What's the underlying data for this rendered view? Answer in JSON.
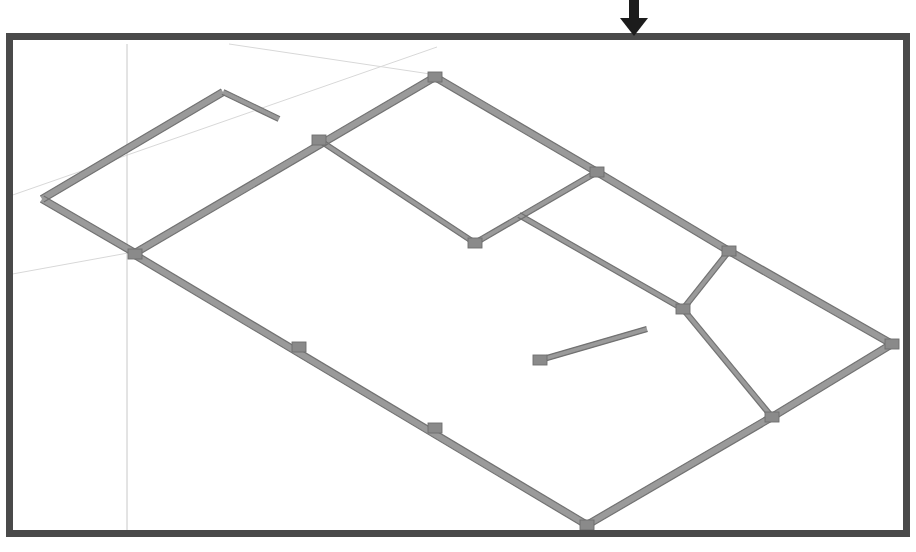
{
  "view": {
    "title": "Floor Plan",
    "background_color": "#ffffff",
    "crop_border_color": "#4a4a4a",
    "crop_border_width": 7,
    "crop_region": {
      "x": 6,
      "y": 33,
      "width": 904,
      "height": 504
    }
  },
  "annotation": {
    "arrow": {
      "name": "crop-region-drag-arrow",
      "direction": "down",
      "color": "#1c1c1c",
      "x": 634,
      "y_top": 0,
      "y_bottom": 36
    }
  },
  "graphics": {
    "wall_color": "#808080",
    "wall_edge_color": "#6e6e6e",
    "wall_fill_color": "#9a9a9a",
    "junction_marker_color": "#8a8a8a",
    "grid_line_color": "#c8c8c8",
    "reference_plane_color": "#d8d8d8",
    "wall_thickness_px": 7,
    "wall_thin_thickness_px": 5
  },
  "grid_lines": [
    {
      "name": "vertical-grid-line",
      "x1": 120,
      "y1": 37,
      "x2": 120,
      "y2": 533
    }
  ],
  "reference_planes": [
    {
      "name": "reference-plane-diagonal-upper",
      "x1": 0,
      "y1": 190,
      "x2": 430,
      "y2": 40
    },
    {
      "name": "reference-plane-diagonal-lower",
      "x1": 0,
      "y1": 268,
      "x2": 132,
      "y2": 244
    },
    {
      "name": "reference-plane-long-diagonal",
      "x1": 128,
      "y1": 248,
      "x2": 620,
      "y2": 545
    },
    {
      "name": "reference-plane-top-sliver",
      "x1": 222,
      "y1": 37,
      "x2": 430,
      "y2": 68
    }
  ],
  "walls": [
    {
      "name": "wall-exterior-north-west",
      "x1": 35,
      "y1": 192,
      "x2": 216,
      "y2": 85,
      "type": "exterior"
    },
    {
      "name": "wall-stub-north",
      "x1": 216,
      "y1": 85,
      "x2": 272,
      "y2": 112,
      "type": "interior"
    },
    {
      "name": "wall-exterior-west",
      "x1": 35,
      "y1": 192,
      "x2": 128,
      "y2": 246,
      "type": "exterior"
    },
    {
      "name": "wall-exterior-north-east",
      "x1": 128,
      "y1": 246,
      "x2": 428,
      "y2": 70,
      "type": "exterior"
    },
    {
      "name": "wall-exterior-north-east-upper",
      "x1": 428,
      "y1": 70,
      "x2": 590,
      "y2": 165,
      "type": "exterior"
    },
    {
      "name": "wall-exterior-east-upper",
      "x1": 590,
      "y1": 165,
      "x2": 722,
      "y2": 244,
      "type": "exterior"
    },
    {
      "name": "wall-exterior-east-lower",
      "x1": 722,
      "y1": 244,
      "x2": 885,
      "y2": 337,
      "type": "exterior"
    },
    {
      "name": "wall-exterior-south-east",
      "x1": 885,
      "y1": 337,
      "x2": 765,
      "y2": 410,
      "type": "exterior"
    },
    {
      "name": "wall-exterior-south",
      "x1": 765,
      "y1": 410,
      "x2": 580,
      "y2": 518,
      "type": "exterior"
    },
    {
      "name": "wall-exterior-south-west",
      "x1": 580,
      "y1": 518,
      "x2": 128,
      "y2": 248,
      "type": "exterior"
    },
    {
      "name": "wall-interior-room-north",
      "x1": 312,
      "y1": 133,
      "x2": 468,
      "y2": 236,
      "type": "interior"
    },
    {
      "name": "wall-interior-room-east",
      "x1": 468,
      "y1": 236,
      "x2": 590,
      "y2": 165,
      "type": "interior"
    },
    {
      "name": "wall-interior-spine-upper",
      "x1": 512,
      "y1": 208,
      "x2": 676,
      "y2": 302,
      "type": "interior"
    },
    {
      "name": "wall-interior-spine-lower",
      "x1": 676,
      "y1": 302,
      "x2": 765,
      "y2": 410,
      "type": "interior"
    },
    {
      "name": "wall-interior-cross",
      "x1": 676,
      "y1": 302,
      "x2": 722,
      "y2": 244,
      "type": "interior"
    },
    {
      "name": "wall-interior-stub-short",
      "x1": 640,
      "y1": 322,
      "x2": 533,
      "y2": 353,
      "type": "interior"
    }
  ],
  "junction_markers": [
    {
      "name": "wall-junction-marker",
      "x": 428,
      "y": 70
    },
    {
      "name": "wall-junction-marker",
      "x": 312,
      "y": 133
    },
    {
      "name": "wall-junction-marker",
      "x": 590,
      "y": 165
    },
    {
      "name": "wall-junction-marker",
      "x": 468,
      "y": 236
    },
    {
      "name": "wall-junction-marker",
      "x": 722,
      "y": 244
    },
    {
      "name": "wall-junction-marker",
      "x": 676,
      "y": 302
    },
    {
      "name": "wall-junction-marker",
      "x": 765,
      "y": 410
    },
    {
      "name": "wall-junction-marker",
      "x": 885,
      "y": 337
    },
    {
      "name": "wall-junction-marker",
      "x": 128,
      "y": 247
    },
    {
      "name": "wall-junction-marker",
      "x": 292,
      "y": 340
    },
    {
      "name": "wall-junction-marker",
      "x": 428,
      "y": 421
    },
    {
      "name": "wall-junction-marker",
      "x": 580,
      "y": 518
    },
    {
      "name": "wall-endpoint-marker",
      "x": 533,
      "y": 353
    }
  ]
}
